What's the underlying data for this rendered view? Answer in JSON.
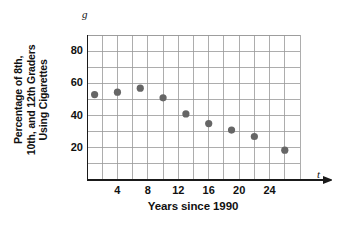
{
  "chart_data": {
    "type": "scatter",
    "title": "",
    "xlabel": "Years since 1990",
    "ylabel": "Percentage of 8th, 10th, and 12th Graders Using Cigarettes",
    "ylabel_lines": [
      "Percentage of 8th,",
      "10th, and 12th Graders",
      "Using Cigarettes"
    ],
    "x_axis_symbol": "t",
    "y_axis_symbol": "g",
    "xlim": [
      0,
      28
    ],
    "ylim": [
      0,
      90
    ],
    "x_ticks": [
      4,
      8,
      12,
      16,
      20,
      24
    ],
    "y_ticks": [
      20,
      40,
      60,
      80
    ],
    "x_tick_labels": [
      "4",
      "8",
      "12",
      "16",
      "20",
      "24"
    ],
    "y_tick_labels": [
      "20",
      "40",
      "60",
      "80"
    ],
    "grid": true,
    "grid_x_step": 2,
    "grid_y_step": 10,
    "legend": "none",
    "marker_color": "#666666",
    "grid_color": "#999999",
    "axis_color": "#1a1a1a",
    "x": [
      1,
      4,
      7,
      10,
      13,
      16,
      19,
      22,
      26
    ],
    "y": [
      53,
      54.5,
      57,
      51,
      41,
      35,
      31,
      27,
      18.5
    ],
    "points": [
      {
        "t": 1,
        "g": 53
      },
      {
        "t": 4,
        "g": 54.5
      },
      {
        "t": 7,
        "g": 57
      },
      {
        "t": 10,
        "g": 51
      },
      {
        "t": 13,
        "g": 41
      },
      {
        "t": 16,
        "g": 35
      },
      {
        "t": 19,
        "g": 31
      },
      {
        "t": 22,
        "g": 27
      },
      {
        "t": 26,
        "g": 18.5
      }
    ]
  }
}
